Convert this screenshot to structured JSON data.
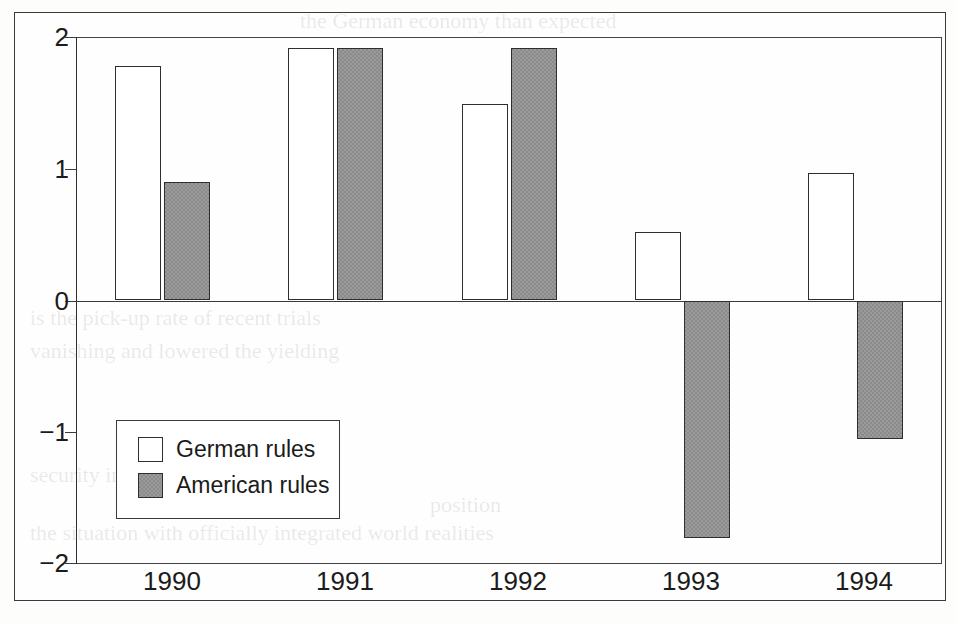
{
  "chart_data": {
    "type": "bar",
    "title": "",
    "subtitle": "",
    "xlabel": "",
    "ylabel": "",
    "categories": [
      "1990",
      "1991",
      "1992",
      "1993",
      "1994"
    ],
    "series": [
      {
        "name": "German rules",
        "values": [
          1.78,
          1.92,
          1.49,
          0.52,
          0.97
        ]
      },
      {
        "name": "American rules",
        "values": [
          0.9,
          1.92,
          1.92,
          -1.8,
          -1.05
        ]
      }
    ],
    "ylim": [
      -2,
      2
    ],
    "yticks": [
      2,
      1,
      0,
      -1,
      -2
    ],
    "ytick_labels": [
      "2",
      "1",
      "0",
      "−1",
      "−2"
    ],
    "grid": false,
    "zero_line": true,
    "legend_position": "inside-lower-left",
    "colors": {
      "german": "#ffffff",
      "american": "#8b8b8b",
      "outline": "#2e2e2e",
      "axis": "#3b3b3b",
      "text": "#1b1b1b",
      "background": "#fefefe"
    }
  },
  "legend": {
    "items": [
      {
        "label": "German rules",
        "swatch": "white-square"
      },
      {
        "label": "American rules",
        "swatch": "gray-square"
      }
    ]
  },
  "axis": {
    "y_labels": [
      "2",
      "1",
      "0",
      "−1",
      "−2"
    ],
    "x_labels": [
      "1990",
      "1991",
      "1992",
      "1993",
      "1994"
    ]
  },
  "ghost": {
    "lines": [
      "the German economy than expected",
      "is the pick-up rate of recent trials",
      "vanishing and lowered the yielding",
      "security in the international growth",
      "position",
      "the situation with officially integrated world realities",
      "is accompanied in from the American",
      "than the German accounting"
    ]
  }
}
